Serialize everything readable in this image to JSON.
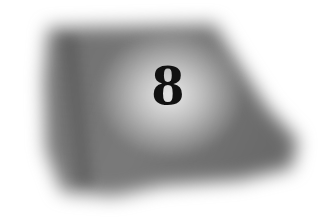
{
  "image": {
    "description": "Blurred grayscale airbrushed dark blob with a light central glow containing a numeral",
    "numeral": "8",
    "colors": {
      "background": "#ffffff",
      "blob_dark": "#5a5a5a",
      "blob_mid": "#8a8a8a",
      "glow": "#eeeeee",
      "numeral": "#111111"
    }
  }
}
